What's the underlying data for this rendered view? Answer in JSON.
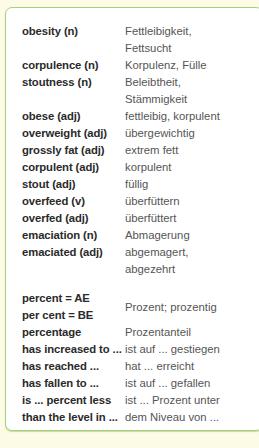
{
  "vocab": [
    {
      "en": "obesity (n)",
      "de": [
        "Fettleibigkeit,",
        "Fettsucht"
      ]
    },
    {
      "en": "corpulence (n)",
      "de": [
        "Korpulenz, Fülle"
      ]
    },
    {
      "en": "stoutness (n)",
      "de": [
        "Beleibtheit,",
        "Stämmigkeit"
      ]
    },
    {
      "en": "obese (adj)",
      "de": [
        "fettleibig, korpulent"
      ]
    },
    {
      "en": "overweight (adj)",
      "de": [
        "übergewichtig"
      ]
    },
    {
      "en": "grossly fat (adj)",
      "de": [
        "extrem fett"
      ]
    },
    {
      "en": "corpulent (adj)",
      "de": [
        "korpulent"
      ]
    },
    {
      "en": "stout (adj)",
      "de": [
        "füllig"
      ]
    },
    {
      "en": "overfeed (v)",
      "de": [
        "überfüttern"
      ]
    },
    {
      "en": "overfed (adj)",
      "de": [
        "überfüttert"
      ]
    },
    {
      "en": "emaciation (n)",
      "de": [
        "Abmagerung"
      ]
    },
    {
      "en": "emaciated (adj)",
      "de": [
        "abgemagert,",
        "abgezehrt"
      ]
    }
  ],
  "phrases": {
    "percent_ae": "percent = AE",
    "percent_be": "per cent = BE",
    "percent_de": "Prozent; prozentig",
    "items": [
      {
        "en": "percentage",
        "de": "Prozentanteil"
      },
      {
        "en": "has increased to ...",
        "de": "ist auf ... gestiegen"
      },
      {
        "en": "has reached ...",
        "de": "hat ... erreicht"
      },
      {
        "en": "has fallen to ...",
        "de": "ist auf ... gefallen"
      },
      {
        "en": "is ... percent less",
        "de": "ist ... Prozent unter"
      },
      {
        "en": "than the level in ...",
        "de": "dem Niveau von ..."
      }
    ]
  }
}
